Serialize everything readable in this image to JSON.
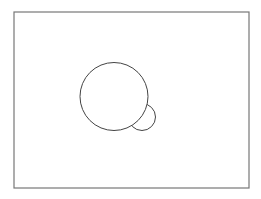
{
  "diagram": {
    "frame": {
      "x": 14,
      "y": 12,
      "width": 235,
      "height": 176,
      "stroke": "#777777",
      "stroke_width": 1.2
    },
    "shapes": [
      {
        "name": "large-circle",
        "cx": 114,
        "cy": 96.5,
        "r": 34,
        "stroke": "#444444",
        "stroke_width": 1
      },
      {
        "name": "small-circle",
        "cx": 142,
        "cy": 117,
        "r": 13.5,
        "stroke": "#444444",
        "stroke_width": 1,
        "occluded_by": "large-circle"
      }
    ],
    "background": "#ffffff"
  }
}
